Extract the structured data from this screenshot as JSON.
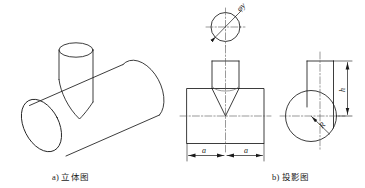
{
  "figure": {
    "background_color": "#ffffff",
    "line_color": "#1a1a1a",
    "center_line_color": "#555555",
    "panels": [
      {
        "id": "isometric",
        "caption": "a) 立体图",
        "description": "horizontal-cylinder-with-vertical-cylinder-intersection"
      },
      {
        "id": "projection",
        "caption": "b) 投影图",
        "description": "three-view-orthographic-projection"
      }
    ]
  },
  "captions": {
    "isometric": "a) 立体图",
    "projection": "b) 投影图"
  },
  "annotations": {
    "diameter_label": "φy",
    "width_left_label": "a",
    "width_right_label": "a",
    "height_label": "h",
    "radius_label": "R"
  },
  "views": {
    "top_view": {
      "name": "top-view-circle",
      "dimension": "φy"
    },
    "front_view": {
      "name": "front-view-tee",
      "dimensions": [
        "a",
        "a"
      ]
    },
    "side_view": {
      "name": "side-view-circle-and-rect",
      "dimensions": [
        "h",
        "R"
      ]
    }
  }
}
